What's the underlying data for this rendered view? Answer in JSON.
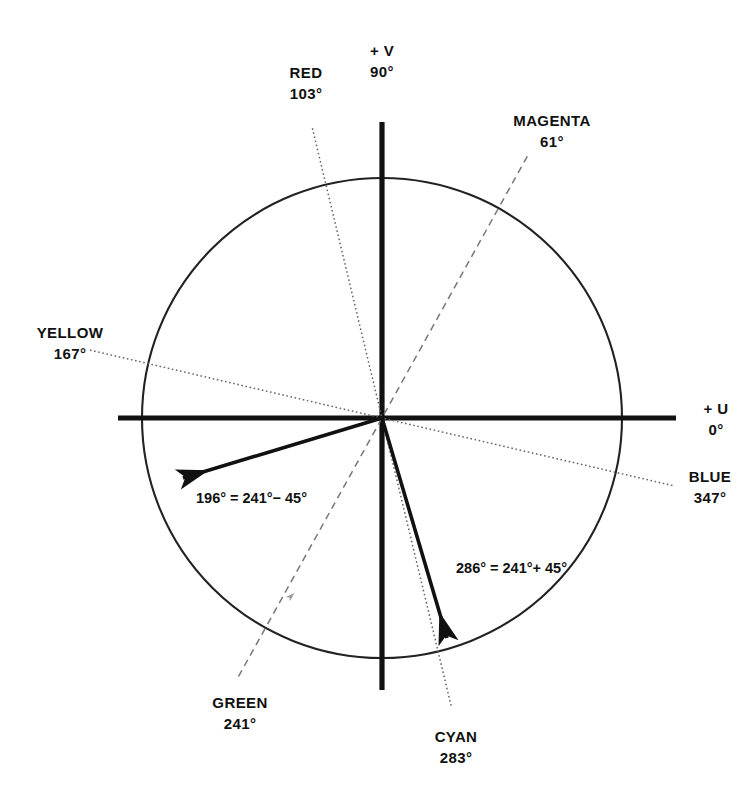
{
  "figure": {
    "type": "uv-phase-diagram",
    "center": {
      "x": 382,
      "y": 418
    },
    "radius": 240,
    "axes": {
      "v_axis": {
        "label_line1": "+ V",
        "label_line2": "90°",
        "angle_deg": 90
      },
      "u_axis": {
        "label_line1": "+ U",
        "label_line2": "0°",
        "angle_deg": 0
      }
    },
    "color_vectors": [
      {
        "name": "RED",
        "label_line1": "RED",
        "label_line2": "103°",
        "angle_deg": 103,
        "style": "dotted"
      },
      {
        "name": "MAGENTA",
        "label_line1": "MAGENTA",
        "label_line2": "61°",
        "angle_deg": 61,
        "style": "dashed"
      },
      {
        "name": "YELLOW",
        "label_line1": "YELLOW",
        "label_line2": "167°",
        "angle_deg": 167,
        "style": "dotted"
      },
      {
        "name": "BLUE",
        "label_line1": "BLUE",
        "label_line2": "347°",
        "angle_deg": 347,
        "style": "dotted"
      },
      {
        "name": "GREEN",
        "label_line1": "GREEN",
        "label_line2": "241°",
        "angle_deg": 241,
        "style": "dashed"
      },
      {
        "name": "CYAN",
        "label_line1": "CYAN",
        "label_line2": "283°",
        "angle_deg": 283,
        "style": "dotted"
      }
    ],
    "burst_vectors": [
      {
        "name": "burst-minus",
        "angle_deg": 196,
        "eq_line1": "196°  =",
        "eq_line2": "241°− 45°"
      },
      {
        "name": "burst-plus",
        "angle_deg": 286,
        "eq_line1": "286°  =",
        "eq_line2": "241°+ 45°"
      }
    ],
    "colors": {
      "ink": "#111111",
      "thin_line": "#555555",
      "background": "#ffffff"
    }
  }
}
